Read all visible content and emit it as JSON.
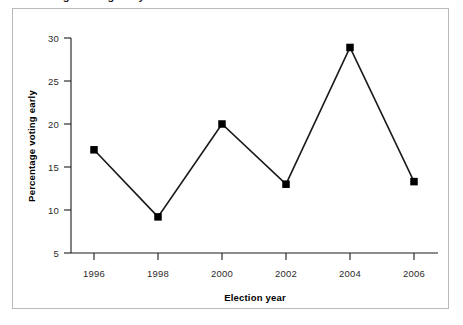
{
  "figure": {
    "caption_remnant": "Percentage voting early",
    "border_color": "#b9b9b9",
    "background": "#ffffff"
  },
  "chart_data": {
    "type": "line",
    "title": "",
    "subtitle": "",
    "xlabel": "Election year",
    "ylabel": "Percentage voting early",
    "categories": [
      "1996",
      "1998",
      "2000",
      "2002",
      "2004",
      "2006"
    ],
    "x": [
      1996,
      1998,
      2000,
      2002,
      2004,
      2006
    ],
    "values": [
      17,
      9.2,
      20,
      13,
      28.9,
      13.3
    ],
    "series": [
      {
        "name": "Percentage voting early",
        "values": [
          17,
          9.2,
          20,
          13,
          28.9,
          13.3
        ]
      }
    ],
    "xtick_labels": [
      "1996",
      "1998",
      "2000",
      "2002",
      "2004",
      "2006"
    ],
    "ytick_labels": [
      "5",
      "10",
      "15",
      "20",
      "25",
      "30"
    ],
    "yticks": [
      5,
      10,
      15,
      20,
      25,
      30
    ],
    "ylim": [
      5,
      30
    ],
    "xlim": [
      1995,
      2007
    ],
    "grid": false,
    "legend": false,
    "legend_position": "none",
    "line_color": "#1a1a1a",
    "marker": "square",
    "marker_color": "#000000",
    "annotations": []
  },
  "y_axis": {
    "label": "Percentage voting early",
    "ticks": [
      {
        "value": 30,
        "label": "30"
      },
      {
        "value": 25,
        "label": "25"
      },
      {
        "value": 20,
        "label": "20"
      },
      {
        "value": 15,
        "label": "15"
      },
      {
        "value": 10,
        "label": "10"
      },
      {
        "value": 5,
        "label": "5"
      }
    ]
  },
  "x_axis": {
    "label": "Election year",
    "ticks": [
      {
        "value": 1996,
        "label": "1996"
      },
      {
        "value": 1998,
        "label": "1998"
      },
      {
        "value": 2000,
        "label": "2000"
      },
      {
        "value": 2002,
        "label": "2002"
      },
      {
        "value": 2004,
        "label": "2004"
      },
      {
        "value": 2006,
        "label": "2006"
      }
    ]
  },
  "points": [
    {
      "year": "1996",
      "value": "17"
    },
    {
      "year": "1998",
      "value": "9.2"
    },
    {
      "year": "2000",
      "value": "20"
    },
    {
      "year": "2002",
      "value": "13"
    },
    {
      "year": "2004",
      "value": "28.9"
    },
    {
      "year": "2006",
      "value": "13.3"
    }
  ]
}
